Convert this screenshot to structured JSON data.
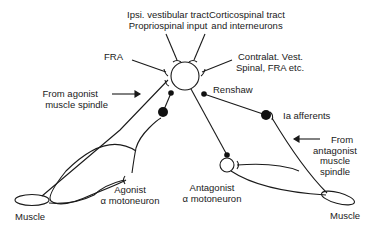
{
  "diagram": {
    "type": "neural-circuit",
    "labels": {
      "ipsi_vestibular": [
        "Ipsi. vestibular tract",
        "Propriospinal input"
      ],
      "corticospinal": [
        "Corticospinal tract",
        "and interneurons"
      ],
      "fra": "FRA",
      "contralat": [
        "Contralat. Vest.",
        "Spinal, FRA etc."
      ],
      "renshaw": "Renshaw",
      "from_agonist": [
        "From agonist",
        "muscle spindle"
      ],
      "ia_afferents": "Ia afferents",
      "from_antagonist": [
        "From",
        "antagonist",
        "muscle",
        "spindle"
      ],
      "agonist_motoneuron": [
        "Agonist",
        "α motoneuron"
      ],
      "antagonist_motoneuron": [
        "Antagonist",
        "α motoneuron"
      ],
      "muscle_left": "Muscle",
      "muscle_right": "Muscle"
    },
    "colors": {
      "stroke": "#1a1a1a",
      "background": "#ffffff"
    }
  }
}
